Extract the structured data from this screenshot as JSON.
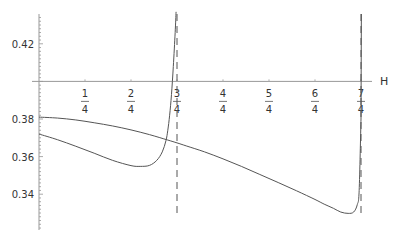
{
  "chart_data": {
    "type": "line",
    "title": "",
    "xlabel": "H",
    "ylabel": "",
    "x_axis_crosses_y_at": 0.4,
    "xlim": [
      0,
      1.8
    ],
    "ylim": [
      0.3215,
      0.4365
    ],
    "grid": false,
    "legend": null,
    "x_ticks": [
      {
        "value": 0.25,
        "num": "1",
        "den": "4"
      },
      {
        "value": 0.5,
        "num": "2",
        "den": "4"
      },
      {
        "value": 0.75,
        "num": "3",
        "den": "4"
      },
      {
        "value": 1.0,
        "num": "4",
        "den": "4"
      },
      {
        "value": 1.25,
        "num": "5",
        "den": "4"
      },
      {
        "value": 1.5,
        "num": "6",
        "den": "4"
      },
      {
        "value": 1.75,
        "num": "7",
        "den": "4"
      }
    ],
    "y_ticks": [
      {
        "value": 0.42,
        "label": "0.42"
      },
      {
        "value": 0.38,
        "label": "0.38"
      },
      {
        "value": 0.36,
        "label": "0.36"
      },
      {
        "value": 0.34,
        "label": "0.34"
      }
    ],
    "asymptotes": [
      {
        "x": 0.75,
        "style": "dashed"
      },
      {
        "x": 1.75,
        "style": "dashed"
      }
    ],
    "series": [
      {
        "name": "curve-A",
        "x": [
          0.0,
          0.1,
          0.2,
          0.3,
          0.4,
          0.5,
          0.6,
          0.7,
          0.75,
          0.8,
          0.9,
          1.0,
          1.1,
          1.2,
          1.3,
          1.4,
          1.5,
          1.55,
          1.6,
          1.64,
          1.68,
          1.71,
          1.73,
          1.74,
          1.75
        ],
        "y": [
          0.381,
          0.3805,
          0.3795,
          0.378,
          0.3763,
          0.3742,
          0.3717,
          0.3688,
          0.3673,
          0.3657,
          0.3625,
          0.3588,
          0.3548,
          0.3505,
          0.3462,
          0.3418,
          0.3372,
          0.3347,
          0.3325,
          0.3305,
          0.3298,
          0.3305,
          0.3345,
          0.342,
          0.38
        ]
      },
      {
        "name": "curve-B",
        "x": [
          0.0,
          0.1,
          0.2,
          0.3,
          0.4,
          0.5,
          0.55,
          0.6,
          0.64,
          0.67,
          0.69,
          0.7,
          0.71,
          0.72,
          0.73,
          0.74,
          0.745
        ],
        "y": [
          0.372,
          0.369,
          0.3655,
          0.3618,
          0.358,
          0.3552,
          0.3548,
          0.3553,
          0.358,
          0.3625,
          0.3685,
          0.374,
          0.382,
          0.393,
          0.408,
          0.426,
          0.437
        ]
      }
    ]
  },
  "axes": {
    "x_label": "H"
  }
}
